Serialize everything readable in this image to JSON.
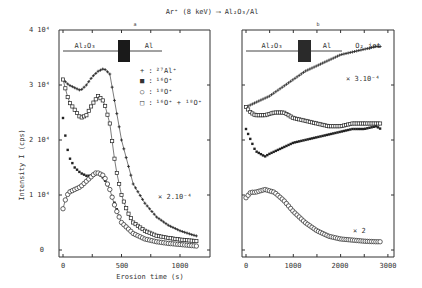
{
  "chart_data": [
    {
      "type": "scatter",
      "panel": "a",
      "title": "Ar+ (8 keV) → Al2O3/Al",
      "xlabel": "Erosion time (s)",
      "ylabel": "Intensity I (cps)",
      "xlim": [
        0,
        1200
      ],
      "ylim": [
        0,
        40000
      ],
      "x_ticks": [
        "0",
        "500",
        "1000"
      ],
      "y_ticks": [
        "0",
        "1 10^4",
        "2 10^4",
        "3 10^4",
        "4 10^4"
      ],
      "layer_labels": [
        "Al2O3",
        "Al"
      ],
      "annotations": [
        "x 2.10^-4"
      ],
      "series": [
        {
          "name": "27Al+",
          "marker": "+",
          "x": [
            0,
            50,
            100,
            150,
            200,
            250,
            300,
            350,
            400,
            450,
            500,
            600,
            700,
            800,
            900,
            1000,
            1100,
            1150
          ],
          "y": [
            31000,
            30000,
            29500,
            29000,
            30000,
            31500,
            32500,
            33000,
            32000,
            26000,
            20000,
            12000,
            8500,
            6000,
            4500,
            3500,
            2800,
            2500
          ]
        },
        {
          "name": "16O+",
          "marker": "filled-square",
          "x": [
            0,
            25,
            50,
            100,
            150,
            200,
            250,
            300,
            350,
            400,
            450,
            500,
            600,
            700,
            800,
            900,
            1000,
            1100,
            1150
          ],
          "y": [
            24000,
            20000,
            17000,
            15000,
            14000,
            13500,
            13500,
            14000,
            13000,
            11000,
            8000,
            5000,
            3000,
            2000,
            1500,
            1200,
            1000,
            800,
            700
          ]
        },
        {
          "name": "18O+",
          "marker": "circle",
          "x": [
            0,
            25,
            50,
            100,
            150,
            200,
            250,
            275,
            300,
            350,
            400,
            450,
            500,
            600,
            700,
            800,
            900,
            1000,
            1100,
            1150
          ],
          "y": [
            7500,
            9500,
            10500,
            11000,
            11500,
            12500,
            13500,
            14000,
            14000,
            13500,
            11000,
            7500,
            5000,
            3000,
            2000,
            1500,
            1200,
            1000,
            800,
            700
          ]
        },
        {
          "name": "16O+ + 18O+",
          "marker": "square",
          "x": [
            0,
            25,
            50,
            100,
            150,
            200,
            250,
            300,
            350,
            400,
            450,
            500,
            550,
            600,
            700,
            800,
            900,
            1000,
            1100,
            1150
          ],
          "y": [
            31000,
            29000,
            27000,
            25500,
            24000,
            24500,
            26500,
            28000,
            27000,
            23000,
            15000,
            10000,
            7000,
            5000,
            3500,
            2600,
            2200,
            1900,
            1700,
            1600
          ]
        }
      ],
      "legend": [
        "+ : 27Al+",
        "■ : 16O+",
        "○ : 18O+",
        "□ : 16O+ + 18O+"
      ]
    },
    {
      "type": "scatter",
      "panel": "b",
      "xlabel": "Erosion time (s)",
      "xlim": [
        0,
        3000
      ],
      "ylim": [
        0,
        40000
      ],
      "x_ticks": [
        "0",
        "1000",
        "2000",
        "3000"
      ],
      "layer_labels": [
        "Al2O3",
        "Al",
        "O2 jet"
      ],
      "annotations": [
        "x 3.10^-4",
        "x 2"
      ],
      "series": [
        {
          "name": "27Al+",
          "marker": "+",
          "x": [
            0,
            250,
            500,
            750,
            1000,
            1250,
            1500,
            1750,
            2000,
            2250,
            2500,
            2750,
            2850
          ],
          "y": [
            26000,
            27000,
            28000,
            29500,
            31000,
            32500,
            33500,
            34500,
            35500,
            36000,
            36500,
            37000,
            37000
          ]
        },
        {
          "name": "16O+",
          "marker": "filled-square",
          "x": [
            0,
            100,
            200,
            300,
            400,
            500,
            750,
            1000,
            1250,
            1500,
            1750,
            2000,
            2250,
            2500,
            2750,
            2850
          ],
          "y": [
            22000,
            20000,
            18000,
            17500,
            17000,
            17500,
            18500,
            19500,
            20000,
            20500,
            21000,
            21500,
            22000,
            22000,
            22500,
            22000
          ]
        },
        {
          "name": "16O+ + 18O+",
          "marker": "square",
          "x": [
            0,
            100,
            200,
            400,
            600,
            800,
            1000,
            1250,
            1500,
            1750,
            2000,
            2250,
            2500,
            2750,
            2850
          ],
          "y": [
            26000,
            25000,
            24500,
            24500,
            25000,
            25000,
            24000,
            23500,
            23000,
            22500,
            22500,
            23000,
            23000,
            23000,
            23000
          ]
        },
        {
          "name": "18O+",
          "marker": "circle",
          "x": [
            0,
            100,
            200,
            400,
            600,
            800,
            1000,
            1250,
            1500,
            1750,
            2000,
            2250,
            2500,
            2750,
            2850
          ],
          "y": [
            9500,
            10500,
            10500,
            11000,
            10500,
            9000,
            7000,
            5000,
            3500,
            2500,
            2000,
            1800,
            1600,
            1500,
            1500
          ]
        }
      ]
    }
  ],
  "title": "Ar⁺ (8 keV) ⟶ Al₂O₃/Al",
  "panel_a_label": "a",
  "panel_b_label": "b",
  "y_axis_label": "Intensity  I  (cps)",
  "x_axis_label": "Erosion  time  (s)",
  "left": {
    "y_ticks": [
      "0",
      "1 10⁴",
      "2 10⁴",
      "3 10⁴",
      "4 10⁴"
    ],
    "x_ticks": [
      "0",
      "500",
      "1000"
    ],
    "layer_oxide": "Al₂O₃",
    "layer_metal": "Al",
    "scale_note": "× 2.10⁻⁴",
    "legend": [
      {
        "sym": "+ :",
        "label": "²⁷Al⁺"
      },
      {
        "sym": "■ :",
        "label": "¹⁶O⁺"
      },
      {
        "sym": "○ :",
        "label": "¹⁸O⁺"
      },
      {
        "sym": "□ :",
        "label": "¹⁶O⁺ + ¹⁸O⁺"
      }
    ]
  },
  "right": {
    "x_ticks": [
      "0",
      "1000",
      "2000",
      "3000"
    ],
    "layer_oxide": "Al₂O₃",
    "layer_metal": "Al",
    "jet_label": "O₂ jet",
    "scale_note_top": "× 3.10⁻⁴",
    "scale_note_bottom": "× 2"
  }
}
